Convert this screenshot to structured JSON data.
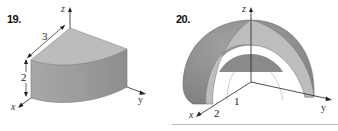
{
  "figures": [
    {
      "number": "19.",
      "description": "Quarter-cylinder wedge in first octant",
      "axes": {
        "x": "x",
        "y": "y",
        "z": "z"
      },
      "dimensions": {
        "radius": "3",
        "height": "2"
      }
    },
    {
      "number": "20.",
      "description": "Half spherical shell between radii 1 and 2",
      "axes": {
        "x": "x",
        "y": "y",
        "z": "z"
      },
      "radii": {
        "inner": "1",
        "outer": "2"
      }
    }
  ],
  "colors": {
    "solid_top": "#b8b8b8",
    "solid_side": "#9a9a9a",
    "shell_outer": "#8f8f8f",
    "shell_cut": "#bdbdbd",
    "axis": "#222222"
  }
}
